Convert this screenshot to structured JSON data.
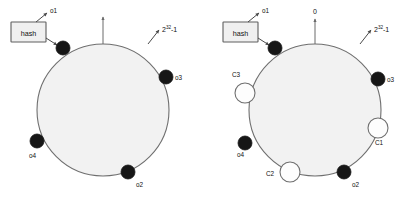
{
  "figure": {
    "colors": {
      "ring_fill": "#f2f2f2",
      "ring_stroke": "#6f6f6f",
      "object_node_fill": "#161616",
      "cache_node_fill": "#fdfdfd",
      "text": "#111111",
      "background": "#ffffff"
    }
  },
  "panels": [
    {
      "id": "left",
      "name": "objects-only-ring",
      "hash_box": {
        "label": "hash"
      },
      "top_marker": {
        "label": ""
      },
      "range_label": {
        "base": "2",
        "exponent": "32",
        "suffix": "-1"
      },
      "pointer_label": {
        "label": "o1"
      },
      "objects": [
        {
          "id": "o1",
          "label": "o1"
        },
        {
          "id": "o2",
          "label": "o2"
        },
        {
          "id": "o3",
          "label": "o3"
        },
        {
          "id": "o4",
          "label": "o4"
        }
      ],
      "caches": []
    },
    {
      "id": "right",
      "name": "objects-and-caches-ring",
      "hash_box": {
        "label": "hash"
      },
      "top_marker": {
        "label": "0"
      },
      "range_label": {
        "base": "2",
        "exponent": "32",
        "suffix": "-1"
      },
      "pointer_label": {
        "label": "o1"
      },
      "objects": [
        {
          "id": "o1",
          "label": "o1"
        },
        {
          "id": "o2",
          "label": "o2"
        },
        {
          "id": "o3",
          "label": "o3"
        },
        {
          "id": "o4",
          "label": "o4"
        }
      ],
      "caches": [
        {
          "id": "C1",
          "label": "C1"
        },
        {
          "id": "C2",
          "label": "C2"
        },
        {
          "id": "C3",
          "label": "C3"
        }
      ]
    }
  ]
}
